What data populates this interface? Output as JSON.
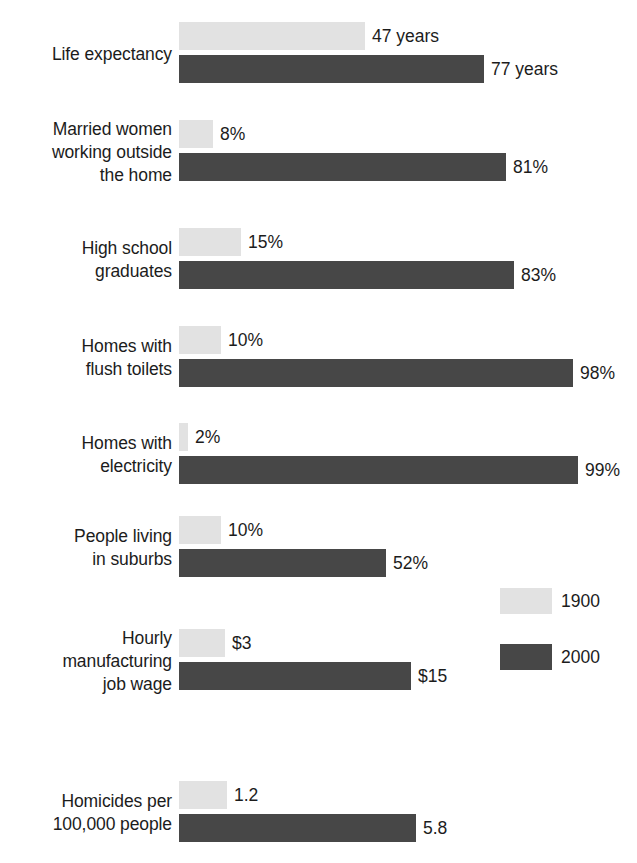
{
  "chart_data": {
    "type": "bar",
    "orientation": "horizontal",
    "title": "",
    "subtitle": "",
    "xlabel": "",
    "ylabel": "",
    "grid": false,
    "legend_position": "right-middle",
    "axis_visible": false,
    "categories": [
      "Life expectancy",
      "Married women\nworking outside\nthe home",
      "High school\ngraduates",
      "Homes with\nflush toilets",
      "Homes with\nelectricity",
      "People living\nin suburbs",
      "Hourly\nmanufacturing\njob wage",
      "Homicides per\n100,000 people"
    ],
    "series": [
      {
        "name": "1900",
        "color": "#e2e2e2",
        "values": [
          47,
          8,
          15,
          10,
          2,
          10,
          3,
          1.2
        ],
        "value_labels": [
          "47 years",
          "8%",
          "15%",
          "10%",
          "2%",
          "10%",
          "$3",
          "1.2"
        ]
      },
      {
        "name": "2000",
        "color": "#474747",
        "values": [
          77,
          81,
          83,
          98,
          99,
          52,
          15,
          5.8
        ],
        "value_labels": [
          "77 years",
          "81%",
          "83%",
          "98%",
          "99%",
          "52%",
          "$15",
          "5.8"
        ]
      }
    ],
    "rows": [
      {
        "label": "Life expectancy",
        "old_value": 47,
        "old_label": "47 years",
        "old_width": 186,
        "new_value": 77,
        "new_label": "77 years",
        "new_width": 305,
        "top": 22
      },
      {
        "label": "Married women\nworking outside\nthe home",
        "old_value": 8,
        "old_label": "8%",
        "old_width": 34,
        "new_value": 81,
        "new_label": "81%",
        "new_width": 327,
        "top": 120
      },
      {
        "label": "High school\ngraduates",
        "old_value": 15,
        "old_label": "15%",
        "old_width": 62,
        "new_value": 83,
        "new_label": "83%",
        "new_width": 335,
        "top": 228
      },
      {
        "label": "Homes with\nflush toilets",
        "old_value": 10,
        "old_label": "10%",
        "old_width": 42,
        "new_value": 98,
        "new_label": "98%",
        "new_width": 394,
        "top": 326
      },
      {
        "label": "Homes with\nelectricity",
        "old_value": 2,
        "old_label": "2%",
        "old_width": 9,
        "new_value": 99,
        "new_label": "99%",
        "new_width": 399,
        "top": 423
      },
      {
        "label": "People living\nin suburbs",
        "old_value": 10,
        "old_label": "10%",
        "old_width": 42,
        "new_value": 52,
        "new_label": "52%",
        "new_width": 207,
        "top": 516
      },
      {
        "label": "Hourly\nmanufacturing\njob wage",
        "old_value": 3,
        "old_label": "$3",
        "old_width": 46,
        "new_value": 15,
        "new_label": "$15",
        "new_width": 232,
        "top": 629
      },
      {
        "label": "Homicides per\n100,000 people",
        "old_value": 1.2,
        "old_label": "1.2",
        "old_width": 48,
        "new_value": 5.8,
        "new_label": "5.8",
        "new_width": 237,
        "top": 781
      }
    ]
  },
  "legend": {
    "items": [
      {
        "label": "1900",
        "color": "#e2e2e2"
      },
      {
        "label": "2000",
        "color": "#474747"
      }
    ]
  },
  "colors": {
    "series_1900": "#e2e2e2",
    "series_2000": "#474747",
    "text": "#1c1c1c",
    "background": "#ffffff"
  }
}
